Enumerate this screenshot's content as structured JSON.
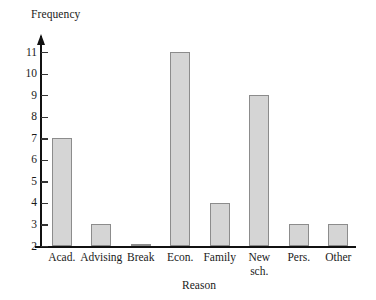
{
  "chart_data": {
    "type": "bar",
    "title": "",
    "xlabel": "Reason",
    "ylabel": "Frequency",
    "categories": [
      "Acad.",
      "Advising",
      "Break",
      "Econ.",
      "Family",
      "New\nsch.",
      "Pers.",
      "Other"
    ],
    "values": [
      7,
      3,
      2,
      11,
      4,
      9,
      3,
      3
    ],
    "ylim": [
      2,
      11
    ],
    "yticks": [
      2,
      3,
      4,
      5,
      6,
      7,
      8,
      9,
      10,
      11
    ],
    "ytick_labels": [
      "2",
      "3",
      "4",
      "5",
      "6",
      "7",
      "8",
      "9",
      "10",
      "11"
    ],
    "grid": false,
    "legend": false,
    "axis_break": true,
    "colors": {
      "bar_fill": "#d5d5d5",
      "bar_edge": "#8c8c8c",
      "axis": "#111111",
      "text": "#1a1a1a",
      "background": "#ffffff"
    }
  }
}
